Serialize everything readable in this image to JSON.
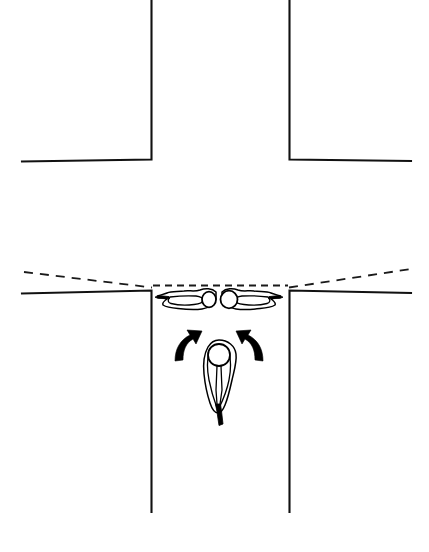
{
  "figure": {
    "background_color": "#ffffff",
    "line_color": "#111111",
    "fill_color": "#000000",
    "width": 429,
    "height": 552
  },
  "scene": {
    "roads": {
      "label": "street-intersection",
      "upper_block": {
        "label": "upper-building-block",
        "left_wall_label": "upper-left-corner",
        "right_wall_label": "upper-right-corner",
        "corner_y": 159,
        "left_corner_x": 151,
        "right_corner_x": 289
      },
      "lower_block": {
        "label": "lower-building-block",
        "corner_y": 290,
        "left_corner_x": 151,
        "right_corner_x": 289,
        "wall_bottom_y": 512
      },
      "cross_street_far_edge": {
        "label": "far-curb-dashed",
        "style": "dashed"
      },
      "vertical_street_label": "vertical-street",
      "horizontal_street_label": "horizontal-cross-street"
    },
    "figures": [
      {
        "id": "soldier-prone-left",
        "name": "prone-soldier-facing-left",
        "posture": "prone",
        "facing": "left",
        "weapon": "rifle",
        "position": {
          "x": 190,
          "y": 299
        }
      },
      {
        "id": "soldier-prone-right",
        "name": "prone-soldier-facing-right",
        "posture": "prone",
        "facing": "right",
        "weapon": "rifle",
        "position": {
          "x": 248,
          "y": 299
        }
      },
      {
        "id": "soldier-crouching-rear",
        "name": "crouching-soldier-rear-security",
        "posture": "crouching",
        "facing": "down",
        "weapon": "rifle",
        "position": {
          "x": 219,
          "y": 378
        }
      }
    ],
    "arrows": [
      {
        "id": "arrow-left",
        "name": "movement-arrow-to-left-position",
        "direction": "up-left",
        "style": "curved-solid"
      },
      {
        "id": "arrow-right",
        "name": "movement-arrow-to-right-position",
        "direction": "up-right",
        "style": "curved-solid"
      }
    ]
  },
  "labels": {
    "caption": "",
    "annotations": []
  }
}
